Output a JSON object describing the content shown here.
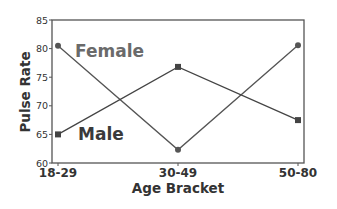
{
  "chart_data": {
    "type": "line",
    "title": "",
    "xlabel": "Age Bracket",
    "ylabel": "Pulse Rate",
    "categories": [
      "18-29",
      "30-49",
      "50-80"
    ],
    "ylim": [
      60,
      85
    ],
    "yticks": [
      60,
      65,
      70,
      75,
      80,
      85
    ],
    "grid": false,
    "legend": "inline labels",
    "series": [
      {
        "name": "Female",
        "marker": "circle",
        "values": [
          80.5,
          62.3,
          80.6
        ],
        "color": "#555555",
        "label_color": "#6a6a6a"
      },
      {
        "name": "Male",
        "marker": "square",
        "values": [
          65,
          76.8,
          67.5
        ],
        "color": "#444444",
        "label_color": "#3a3a3a"
      }
    ],
    "annotations": [
      {
        "text": "Female",
        "near": "18-29",
        "y": 80
      },
      {
        "text": "Male",
        "near": "18-29",
        "y": 65
      }
    ]
  }
}
